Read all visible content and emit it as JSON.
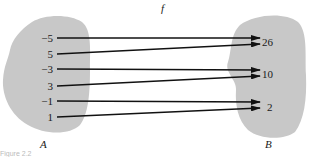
{
  "title": "f",
  "domain_set": {
    "label": "A",
    "elements": [
      "−5",
      "5",
      "−3",
      "3",
      "−1",
      "1"
    ]
  },
  "codomain_set": {
    "label": "B",
    "elements": [
      "26",
      "10",
      "2"
    ]
  },
  "mappings": [
    {
      "from": "−5",
      "to": "26"
    },
    {
      "from": "5",
      "to": "26"
    },
    {
      "from": "−3",
      "to": "10"
    },
    {
      "from": "3",
      "to": "10"
    },
    {
      "from": "−1",
      "to": "2"
    },
    {
      "from": "1",
      "to": "2"
    }
  ],
  "caption": "Figure 2.2",
  "colors": {
    "blob": "#c8c8c8",
    "arrow": "#111111"
  }
}
